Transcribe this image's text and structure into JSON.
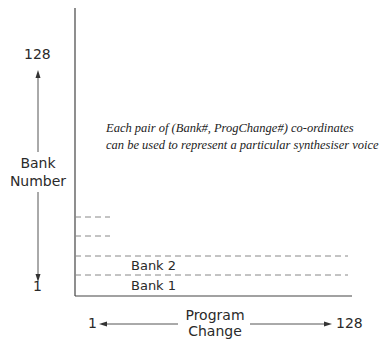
{
  "diagram": {
    "caption_line1": "Each pair of (Bank#, ProgChange#) co-ordinates",
    "caption_line2": "can be used to represent a particular synthesiser voice",
    "y_axis": {
      "label_line1": "Bank",
      "label_line2": "Number",
      "max": "128",
      "min": "1"
    },
    "x_axis": {
      "label_line1": "Program",
      "label_line2": "Change",
      "min": "1",
      "max": "128"
    },
    "rows": [
      {
        "label": "Bank 1"
      },
      {
        "label": "Bank 2"
      }
    ],
    "colors": {
      "axis": "#444444",
      "dash": "#888888",
      "text": "#222222"
    }
  }
}
